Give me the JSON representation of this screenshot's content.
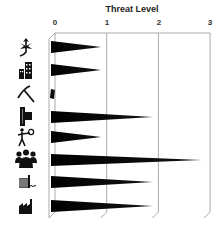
{
  "chart_data": {
    "type": "bar",
    "orientation": "horizontal",
    "bar_shape": "tapered-wedge",
    "title": "Threat Level",
    "xlabel": "Threat Level",
    "ylabel": "",
    "xlim": [
      0,
      3
    ],
    "x_ticks": [
      "0",
      "1",
      "2",
      "3"
    ],
    "grid": true,
    "legend": "none",
    "categories": [
      "plant",
      "buildings",
      "mining",
      "logging",
      "worker",
      "people",
      "water-pollution",
      "industry"
    ],
    "values": [
      0.9,
      0.9,
      0.05,
      1.9,
      0.9,
      2.85,
      1.9,
      1.9
    ],
    "category_icons": [
      "leaf-icon",
      "city-buildings-icon",
      "pickaxe-icon",
      "logging-machine-icon",
      "person-worker-icon",
      "crowd-icon",
      "water-wall-icon",
      "factory-icon"
    ]
  },
  "colors": {
    "bar": "#000000",
    "grid": "#aaaaaa",
    "icon": "#111111"
  }
}
